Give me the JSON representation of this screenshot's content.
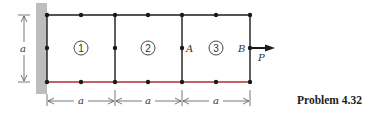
{
  "caption": "Problem 4.32",
  "dimension_label": "a",
  "elements": [
    {
      "number": "1"
    },
    {
      "number": "2"
    },
    {
      "number": "3"
    }
  ],
  "node_labels": {
    "A": "A",
    "B": "B"
  },
  "load": {
    "label": "P",
    "direction": "right"
  },
  "colors": {
    "frame": "#1a1a1a",
    "bottom_edge": "#b0302e",
    "wall": "#bcbcbc",
    "dim": "#555555"
  }
}
